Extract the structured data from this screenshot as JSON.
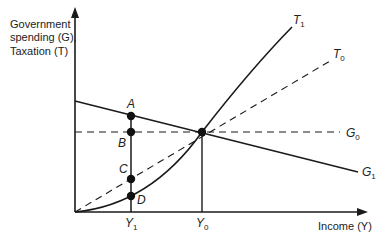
{
  "diagram": {
    "y_axis_label": [
      "Government",
      "spending (G),",
      "Taxation (T)"
    ],
    "x_axis_label": "Income (Y)",
    "curves": {
      "T1": {
        "symbol": "T",
        "sub": "1",
        "style": "solid",
        "shape": "convex curve"
      },
      "T0": {
        "symbol": "T",
        "sub": "0",
        "style": "dashed",
        "shape": "straight line through origin"
      },
      "G0": {
        "symbol": "G",
        "sub": "0",
        "style": "dashed",
        "shape": "horizontal line"
      },
      "G1": {
        "symbol": "G",
        "sub": "1",
        "style": "solid",
        "shape": "downward sloping line"
      }
    },
    "points": [
      "A",
      "B",
      "C",
      "D"
    ],
    "x_ticks": [
      {
        "symbol": "Y",
        "sub": "1"
      },
      {
        "symbol": "Y",
        "sub": "0"
      }
    ],
    "colors": {
      "line": "#1a1a1a",
      "background": "#ffffff"
    }
  }
}
